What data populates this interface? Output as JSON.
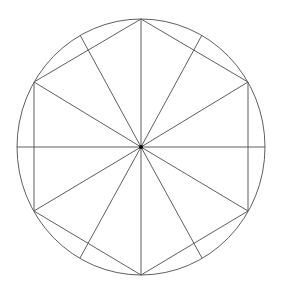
{
  "diagram": {
    "title": "",
    "stroke_color": "#5f5f5f",
    "center_color": "#000000",
    "background": "#ffffff",
    "center": {
      "x": 141,
      "y": 147
    },
    "circle": {
      "cx": 141,
      "cy": 147,
      "rx": 124,
      "ry": 128
    },
    "hexagon": {
      "vertices": [
        {
          "name": "top",
          "x": 141,
          "y": 19
        },
        {
          "name": "upper-right",
          "x": 248,
          "y": 82
        },
        {
          "name": "lower-right",
          "x": 248,
          "y": 211
        },
        {
          "name": "bottom",
          "x": 141,
          "y": 275
        },
        {
          "name": "lower-left",
          "x": 34,
          "y": 211
        },
        {
          "name": "upper-left",
          "x": 34,
          "y": 82
        }
      ]
    },
    "edge_radii_endpoints": [
      {
        "name": "right",
        "x": 265,
        "y": 147
      },
      {
        "name": "lower-right",
        "x": 202,
        "y": 258
      },
      {
        "name": "lower-left",
        "x": 80,
        "y": 258
      },
      {
        "name": "left",
        "x": 17,
        "y": 147
      },
      {
        "name": "upper-left",
        "x": 80,
        "y": 35
      },
      {
        "name": "upper-right",
        "x": 202,
        "y": 35
      }
    ]
  }
}
